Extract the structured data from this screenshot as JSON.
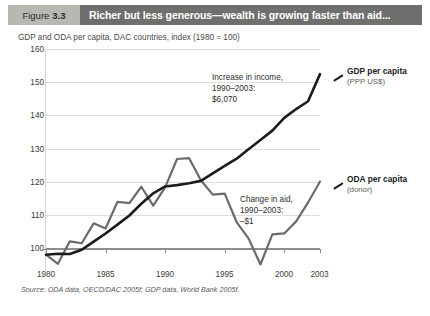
{
  "header": {
    "figure_word": "Figure",
    "figure_number": "3.3",
    "title": "Richer but less generous—wealth is growing faster than aid...",
    "number_box_color": "#b8b8b3",
    "title_box_color": "#6f6f6d"
  },
  "source": {
    "label": "Source:",
    "text": " ODA data, OECD/DAC 2005f; GDP data, World Bank 2005f."
  },
  "annotations": {
    "income": {
      "line1": "Increase in income,",
      "line2": "1990–2003:",
      "line3": "$6,070"
    },
    "aid": {
      "line1": "Change in aid,",
      "line2": "1990–2003:",
      "line3": "–$1"
    }
  },
  "series_labels": {
    "gdp": {
      "name": "GDP per capita",
      "sub": "(PPP US$)"
    },
    "oda": {
      "name": "ODA per capita",
      "sub": "(donor)"
    }
  },
  "chart_data": {
    "type": "line",
    "title": "Richer but less generous—wealth is growing faster than aid...",
    "subtitle": "GDP and ODA per capita, DAC countries, index (1980 = 100)",
    "xlabel": "",
    "ylabel": "",
    "xlim": [
      1980,
      2003
    ],
    "ylim": [
      95,
      163
    ],
    "yticks": [
      100,
      110,
      120,
      130,
      140,
      150,
      160
    ],
    "xticks": [
      1980,
      1985,
      1990,
      1995,
      2000,
      2003
    ],
    "xtick_labels": [
      "1980",
      "1985",
      "1990",
      "1995",
      "2000",
      "2003"
    ],
    "ytick_labels": [
      "100",
      "110",
      "120",
      "130",
      "140",
      "150",
      "160"
    ],
    "grid": true,
    "grid_axis": "y",
    "legend_position": "right-inline",
    "x": [
      1980,
      1981,
      1982,
      1983,
      1984,
      1985,
      1986,
      1987,
      1988,
      1989,
      1990,
      1991,
      1992,
      1993,
      1994,
      1995,
      1996,
      1997,
      1998,
      1999,
      2000,
      2001,
      2002,
      2003
    ],
    "series": [
      {
        "name": "GDP per capita",
        "sub": "(PPP US$)",
        "color": "#1c1c1c",
        "values": [
          100.0,
          100.3,
          100.2,
          101.5,
          104.0,
          106.5,
          109.2,
          112.0,
          115.6,
          118.8,
          120.9,
          121.3,
          121.9,
          122.6,
          124.9,
          127.2,
          129.4,
          132.3,
          135.1,
          138.0,
          141.9,
          144.6,
          147.0,
          155.3
        ]
      },
      {
        "name": "ODA per capita",
        "sub": "(donor)",
        "color": "#6b6b6b",
        "values": [
          100.0,
          97.2,
          104.1,
          103.5,
          109.6,
          108.0,
          116.2,
          115.8,
          120.8,
          115.0,
          120.6,
          129.3,
          129.6,
          122.8,
          118.4,
          118.7,
          110.0,
          105.0,
          97.0,
          106.2,
          106.5,
          110.2,
          116.0,
          122.4
        ]
      }
    ]
  }
}
